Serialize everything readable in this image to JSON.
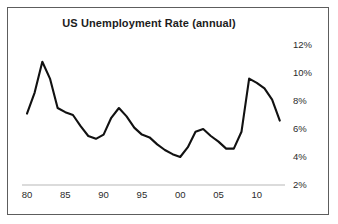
{
  "chart_data": {
    "type": "line",
    "title": "US Unemployment Rate (annual)",
    "xlabel": "",
    "ylabel": "",
    "xlim": [
      1980,
      2013
    ],
    "ylim": [
      2,
      12
    ],
    "grid": false,
    "legend": null,
    "y_unit": "%",
    "y_ticks": [
      12,
      10,
      8,
      6,
      4,
      2
    ],
    "y_tick_labels": [
      "12%",
      "10%",
      "8%",
      "6%",
      "4%",
      "2%"
    ],
    "x_ticks": [
      1980,
      1985,
      1990,
      1995,
      2000,
      2005,
      2010
    ],
    "x_tick_labels": [
      "80",
      "85",
      "90",
      "95",
      "00",
      "05",
      "10"
    ],
    "x": [
      1980,
      1981,
      1982,
      1983,
      1984,
      1985,
      1986,
      1987,
      1988,
      1989,
      1990,
      1991,
      1992,
      1993,
      1994,
      1995,
      1996,
      1997,
      1998,
      1999,
      2000,
      2001,
      2002,
      2003,
      2004,
      2005,
      2006,
      2007,
      2008,
      2009,
      2010,
      2011,
      2012,
      2013
    ],
    "values": [
      7.1,
      8.6,
      10.8,
      9.6,
      7.5,
      7.2,
      7.0,
      6.2,
      5.5,
      5.3,
      5.6,
      6.8,
      7.5,
      6.9,
      6.1,
      5.6,
      5.4,
      4.9,
      4.5,
      4.2,
      4.0,
      4.7,
      5.8,
      6.0,
      5.5,
      5.1,
      4.6,
      4.6,
      5.8,
      9.6,
      9.3,
      8.9,
      8.1,
      6.6
    ],
    "series": [
      {
        "name": "US Unemployment Rate",
        "color": "#111111",
        "values": [
          7.1,
          8.6,
          10.8,
          9.6,
          7.5,
          7.2,
          7.0,
          6.2,
          5.5,
          5.3,
          5.6,
          6.8,
          7.5,
          6.9,
          6.1,
          5.6,
          5.4,
          4.9,
          4.5,
          4.2,
          4.0,
          4.7,
          5.8,
          6.0,
          5.5,
          5.1,
          4.6,
          4.6,
          5.8,
          9.6,
          9.3,
          8.9,
          8.1,
          6.6
        ]
      }
    ]
  },
  "colors": {
    "frame_border": "#5d5d5d",
    "line": "#111111",
    "axis": "#cfcfcf",
    "text": "#2b2b2b",
    "background": "#ffffff"
  }
}
